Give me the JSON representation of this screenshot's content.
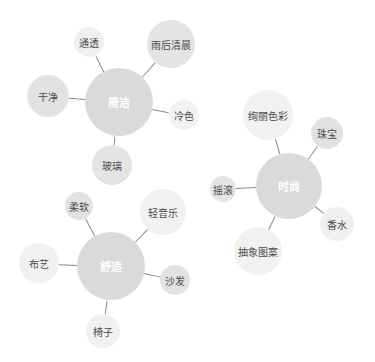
{
  "diagram": {
    "type": "bubble-cluster-mind-map",
    "colors": {
      "background": "#ffffff",
      "center_fill": "#dadada",
      "edge": "#8a8a8a",
      "center_text": "#ffffff",
      "satellite_text": "#4a4a4a"
    },
    "clusters": [
      {
        "id": "jianjie",
        "center": {
          "label": "简洁",
          "x": 119,
          "y": 102,
          "r": 34
        },
        "satellites": [
          {
            "label": "通透",
            "x": 89,
            "y": 42,
            "r": 15,
            "fill": "#f0f0f0"
          },
          {
            "label": "雨后清晨",
            "x": 171,
            "y": 44,
            "r": 24,
            "fill": "#e4e4e4"
          },
          {
            "label": "干净",
            "x": 48,
            "y": 96,
            "r": 21,
            "fill": "#e2e2e2"
          },
          {
            "label": "冷色",
            "x": 184,
            "y": 115,
            "r": 15,
            "fill": "#f2f2f2"
          },
          {
            "label": "玻璃",
            "x": 112,
            "y": 165,
            "r": 20,
            "fill": "#e4e4e4"
          }
        ]
      },
      {
        "id": "shishang",
        "center": {
          "label": "时尚",
          "x": 289,
          "y": 186,
          "r": 33
        },
        "satellites": [
          {
            "label": "绚丽色彩",
            "x": 268,
            "y": 115,
            "r": 25,
            "fill": "#f1f1f1"
          },
          {
            "label": "珠宝",
            "x": 327,
            "y": 133,
            "r": 16,
            "fill": "#e2e2e2"
          },
          {
            "label": "摇滚",
            "x": 223,
            "y": 189,
            "r": 13,
            "fill": "#e4e4e4"
          },
          {
            "label": "香水",
            "x": 337,
            "y": 224,
            "r": 17,
            "fill": "#f0f0f0"
          },
          {
            "label": "抽象图案",
            "x": 258,
            "y": 251,
            "r": 24,
            "fill": "#f1f1f1"
          }
        ]
      },
      {
        "id": "shushi",
        "center": {
          "label": "舒适",
          "x": 111,
          "y": 266,
          "r": 34
        },
        "satellites": [
          {
            "label": "柔软",
            "x": 79,
            "y": 206,
            "r": 14,
            "fill": "#e2e2e2"
          },
          {
            "label": "轻音乐",
            "x": 163,
            "y": 212,
            "r": 23,
            "fill": "#f1f1f1"
          },
          {
            "label": "布艺",
            "x": 39,
            "y": 263,
            "r": 20,
            "fill": "#f1f1f1"
          },
          {
            "label": "沙发",
            "x": 175,
            "y": 280,
            "r": 15,
            "fill": "#e2e2e2"
          },
          {
            "label": "椅子",
            "x": 103,
            "y": 331,
            "r": 17,
            "fill": "#f0f0f0"
          }
        ]
      }
    ]
  }
}
